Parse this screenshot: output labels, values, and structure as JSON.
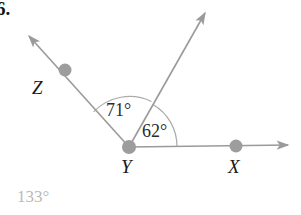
{
  "figure": {
    "problem_number": "6.",
    "answer": "133°",
    "vertex_label": "Y",
    "points": [
      {
        "name": "Z",
        "label": "Z",
        "cx": 65,
        "cy": 70,
        "r": 6.5
      },
      {
        "name": "Y",
        "label": "Y",
        "cx": 129,
        "cy": 147,
        "r": 7
      },
      {
        "name": "X",
        "label": "X",
        "cx": 236,
        "cy": 146,
        "r": 6.5
      }
    ],
    "rays": [
      {
        "name": "ray-yz",
        "from": "Y",
        "through": "Z",
        "tip_x": 26,
        "tip_y": 33
      },
      {
        "name": "ray-yw",
        "from": "Y",
        "through": "upper-right",
        "tip_x": 207,
        "tip_y": 10
      },
      {
        "name": "ray-yx",
        "from": "Y",
        "through": "X",
        "tip_x": 293,
        "tip_y": 145
      }
    ],
    "angles": [
      {
        "name": "angle-zyw",
        "label": "71°",
        "value": 71,
        "radius": 48
      },
      {
        "name": "angle-wyx",
        "label": "62°",
        "value": 62,
        "radius": 46
      }
    ],
    "colors": {
      "line": "#9a9a9a",
      "dot": "#9d9d9d",
      "arc": "#a8a8a8",
      "text": "#1a1a1a",
      "answer": "#b9b9b9",
      "background": "#ffffff"
    }
  }
}
